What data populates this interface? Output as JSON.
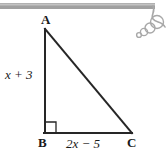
{
  "figure": {
    "type": "right-triangle-diagram",
    "title_alt": "Right triangle ABC with right angle at B",
    "vertices": [
      {
        "name": "A",
        "label": "A",
        "x": 45,
        "y": 29
      },
      {
        "name": "B",
        "label": "B",
        "x": 45,
        "y": 133
      },
      {
        "name": "C",
        "label": "C",
        "x": 132,
        "y": 133
      }
    ],
    "sides": [
      {
        "name": "leg-vertical",
        "from": "A",
        "to": "B",
        "label": "x + 3"
      },
      {
        "name": "leg-horizontal",
        "from": "B",
        "to": "C",
        "label": "2x − 5"
      },
      {
        "name": "hypotenuse",
        "from": "A",
        "to": "C",
        "label": ""
      }
    ],
    "right_angle": {
      "at": "B",
      "marker_size": 11
    },
    "colors": {
      "stroke": "#262626",
      "text": "#1a1a1a",
      "background": "#ffffff",
      "decoration": "#9a9a9a"
    },
    "decoration": {
      "name": "scanned-page-edge-with-bubbles",
      "bar": {
        "x": 0,
        "y": 3,
        "width": 155,
        "height": 6
      },
      "bubbles": [
        {
          "cx": 157,
          "cy": 22,
          "r": 6.5
        },
        {
          "cx": 150,
          "cy": 28,
          "r": 5
        },
        {
          "cx": 144,
          "cy": 32,
          "r": 3.6
        },
        {
          "cx": 139,
          "cy": 35,
          "r": 2.4
        }
      ]
    }
  }
}
